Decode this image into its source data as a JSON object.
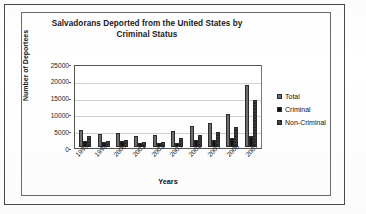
{
  "chart_data": {
    "type": "bar",
    "title": "Salvadorans Deported from the United States by Criminal Status",
    "title_line1": "Salvadorans Deported from the United States by",
    "title_line2": "Criminal Status",
    "xlabel": "Years",
    "ylabel": "Number of Deportees",
    "categories": [
      "1998",
      "1999",
      "2000",
      "2001",
      "2002",
      "2003",
      "2004",
      "2005",
      "2006",
      "2007"
    ],
    "series": [
      {
        "name": "Total",
        "values": [
          5300,
          4000,
          4300,
          3400,
          3700,
          5000,
          6400,
          7400,
          10200,
          19000
        ]
      },
      {
        "name": "Criminal",
        "values": [
          1700,
          1500,
          1800,
          1300,
          1200,
          1300,
          2100,
          2000,
          2800,
          3500
        ]
      },
      {
        "name": "Non-Criminal",
        "values": [
          3400,
          1800,
          2200,
          1600,
          1600,
          2700,
          3600,
          4500,
          6200,
          14400
        ]
      }
    ],
    "ylim": [
      0,
      25000
    ],
    "yticks": [
      "0",
      "5000",
      "10000",
      "15000",
      "20000",
      "25000"
    ],
    "ytick_values": [
      0,
      5000,
      10000,
      15000,
      20000,
      25000
    ],
    "grid": true,
    "legend_position": "right",
    "colors": {
      "total": "#6e6e6e",
      "criminal": "#111111",
      "noncriminal": "#4a4a4a",
      "gridline": "#d2d2d2",
      "axis": "#555555",
      "text": "#1a1a1a"
    }
  },
  "legend": {
    "items": [
      {
        "label": "Total",
        "key": "total"
      },
      {
        "label": "Criminal",
        "key": "criminal"
      },
      {
        "label": "Non-Criminal",
        "key": "noncriminal"
      }
    ]
  }
}
